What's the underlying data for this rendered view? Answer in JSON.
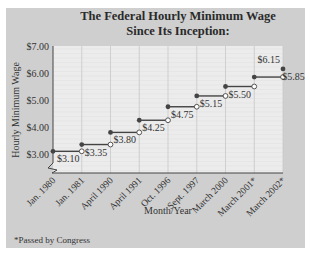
{
  "chart_data": {
    "type": "line",
    "subtype": "step",
    "title": "The Federal Hourly Minimum Wage",
    "subtitle": "Since Its Inception:",
    "xlabel": "Month/Year",
    "ylabel": "Hourly Minimum Wage",
    "ylim": [
      3.0,
      7.0
    ],
    "y_ticks": [
      "$7.00",
      "$6.00",
      "$5.00",
      "$4.00",
      "$3.00"
    ],
    "y_tick_values": [
      7,
      6,
      5,
      4,
      3
    ],
    "y_axis_break": true,
    "grid": true,
    "categories": [
      "Jan. 1980",
      "Jan. 1981",
      "April 1990",
      "April 1991",
      "Oct. 1996",
      "Sept. 1997",
      "March 2000",
      "March 2001*",
      "March 2002*"
    ],
    "values": [
      3.1,
      3.35,
      3.8,
      4.25,
      4.75,
      5.15,
      5.5,
      5.85,
      6.15
    ],
    "labels": [
      "$3.10",
      "$3.35",
      "$3.80",
      "$4.25",
      "$4.75",
      "$5.15",
      "$5.50",
      "$5.85",
      "$6.15"
    ],
    "footnote": "*Passed by Congress"
  },
  "colors": {
    "panel": "#cfcfcf",
    "plot": "#ececec",
    "grid": "#c8c8c8",
    "line": "#444444"
  }
}
